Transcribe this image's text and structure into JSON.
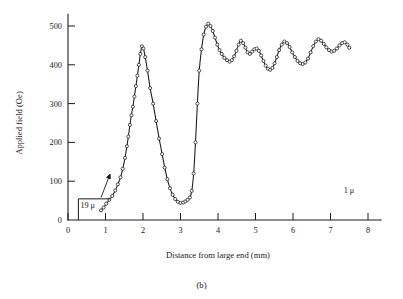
{
  "figure": {
    "caption": "(b)"
  },
  "chart_data": {
    "type": "line",
    "title": "",
    "xlabel": "Distance from large end (mm)",
    "ylabel": "Applied field (Oe)",
    "xlim": [
      0,
      8.35
    ],
    "ylim": [
      0,
      530
    ],
    "grid": false,
    "legend": "none",
    "marker": "open-circle",
    "xticks": [
      0,
      1,
      2,
      3,
      4,
      5,
      6,
      7,
      8
    ],
    "xtick_labels": [
      "0",
      "1",
      "2",
      "3",
      "4",
      "5",
      "6",
      "7",
      "8"
    ],
    "yticks": [
      0,
      100,
      200,
      300,
      400,
      500
    ],
    "ytick_labels": [
      "0",
      "100",
      "200",
      "300",
      "400",
      "500"
    ],
    "annotations": [
      {
        "text": "19 μ",
        "x": 0.33,
        "y": 30,
        "note": "left end diameter marker"
      },
      {
        "text": "1 μ",
        "x": 7.35,
        "y": 70,
        "note": "right end diameter marker"
      }
    ],
    "series": [
      {
        "name": "Applied field",
        "x": [
          0.88,
          0.95,
          1.02,
          1.1,
          1.18,
          1.26,
          1.33,
          1.4,
          1.46,
          1.52,
          1.57,
          1.61,
          1.65,
          1.69,
          1.73,
          1.77,
          1.81,
          1.85,
          1.89,
          1.93,
          1.97,
          2.01,
          2.06,
          2.12,
          2.19,
          2.27,
          2.35,
          2.43,
          2.51,
          2.58,
          2.65,
          2.72,
          2.79,
          2.86,
          2.93,
          3.0,
          3.07,
          3.13,
          3.19,
          3.25,
          3.3,
          3.35,
          3.4,
          3.45,
          3.5,
          3.56,
          3.62,
          3.68,
          3.74,
          3.8,
          3.86,
          3.92,
          3.98,
          4.04,
          4.1,
          4.17,
          4.24,
          4.31,
          4.37,
          4.43,
          4.49,
          4.55,
          4.61,
          4.67,
          4.73,
          4.79,
          4.85,
          4.91,
          4.97,
          5.03,
          5.09,
          5.15,
          5.21,
          5.27,
          5.33,
          5.39,
          5.45,
          5.51,
          5.57,
          5.63,
          5.7,
          5.77,
          5.84,
          5.91,
          5.98,
          6.05,
          6.12,
          6.19,
          6.26,
          6.33,
          6.4,
          6.47,
          6.54,
          6.61,
          6.68,
          6.75,
          6.82,
          6.89,
          6.96,
          7.03,
          7.1,
          7.17,
          7.24,
          7.31,
          7.38,
          7.45,
          7.5
        ],
        "y": [
          25,
          32,
          42,
          52,
          62,
          76,
          92,
          110,
          132,
          160,
          190,
          215,
          245,
          270,
          292,
          318,
          345,
          372,
          400,
          428,
          448,
          442,
          420,
          385,
          340,
          300,
          255,
          210,
          170,
          135,
          105,
          82,
          65,
          54,
          47,
          44,
          45,
          48,
          52,
          58,
          75,
          120,
          200,
          300,
          385,
          440,
          478,
          498,
          506,
          500,
          487,
          470,
          452,
          438,
          428,
          418,
          412,
          408,
          412,
          422,
          436,
          452,
          462,
          456,
          444,
          432,
          428,
          434,
          440,
          442,
          436,
          424,
          410,
          398,
          390,
          387,
          392,
          404,
          420,
          438,
          452,
          460,
          456,
          446,
          432,
          420,
          410,
          404,
          402,
          406,
          416,
          432,
          448,
          460,
          466,
          462,
          454,
          445,
          438,
          434,
          436,
          442,
          450,
          456,
          458,
          452,
          444
        ],
        "color": "#181818"
      }
    ]
  }
}
